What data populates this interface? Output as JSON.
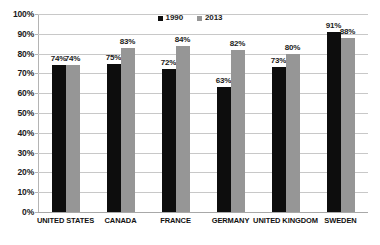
{
  "chart_data": {
    "type": "bar",
    "title": "",
    "subtitle": "",
    "xlabel": "",
    "ylabel": "",
    "ylim": [
      0,
      100
    ],
    "y_unit": "%",
    "grid": true,
    "legend_position": "top-center",
    "categories": [
      "UNITED STATES",
      "CANADA",
      "FRANCE",
      "GERMANY",
      "UNITED KINGDOM",
      "SWEDEN"
    ],
    "y_ticks": [
      "0%",
      "10%",
      "20%",
      "30%",
      "40%",
      "50%",
      "60%",
      "70%",
      "80%",
      "90%",
      "100%"
    ],
    "y_tick_values": [
      0,
      10,
      20,
      30,
      40,
      50,
      60,
      70,
      80,
      90,
      100
    ],
    "series": [
      {
        "name": "1990",
        "color": "#0d0d0d",
        "values": [
          74,
          75,
          72,
          63,
          73,
          91
        ],
        "labels": [
          "74%",
          "75%",
          "72%",
          "63%",
          "73%",
          "91%"
        ]
      },
      {
        "name": "2013",
        "color": "#969696",
        "values": [
          74,
          83,
          84,
          82,
          80,
          88
        ],
        "labels": [
          "74%",
          "83%",
          "84%",
          "82%",
          "80%",
          "88%"
        ]
      }
    ]
  },
  "legend": {
    "items": [
      {
        "label": "1990",
        "swatch": "legend-swatch-1990"
      },
      {
        "label": "2013",
        "swatch": "legend-swatch-2013"
      }
    ]
  },
  "colors": {
    "series_1990": "#0d0d0d",
    "series_2013": "#969696",
    "gridline": "#c8c8c8",
    "axis": "#b4b4b4",
    "text": "#1a1a1a",
    "background": "#ffffff"
  }
}
